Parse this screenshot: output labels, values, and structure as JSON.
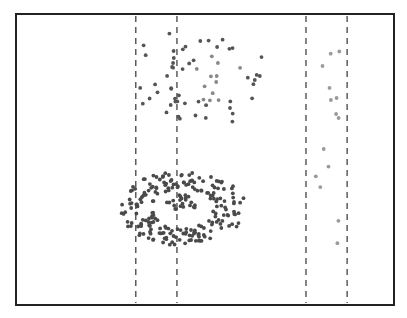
{
  "chart_data": {
    "type": "scatter",
    "title": "",
    "xlabel": "",
    "ylabel": "",
    "xlim": [
      0,
      100
    ],
    "ylim": [
      0,
      100
    ],
    "grid": false,
    "legend": "none",
    "vertical_dashed_lines_x": [
      31.5,
      42.5,
      77,
      88
    ],
    "clusters": [
      {
        "name": "upper-left-scatter",
        "shape": "uniform",
        "x_range": [
          31,
          46
        ],
        "y_range": [
          58,
          94
        ],
        "count": 18,
        "color": "#555555"
      },
      {
        "name": "upper-radial-cluster",
        "shape": "radial",
        "center": [
          53.5,
          78
        ],
        "radius": 14,
        "count": 45,
        "color": "#555555",
        "inner_color": "#888888"
      },
      {
        "name": "ring-cluster",
        "shape": "ring",
        "center": [
          44,
          33
        ],
        "rx_inner": 8,
        "rx_outer": 17,
        "ry_inner": 7,
        "ry_outer": 13,
        "count": 210,
        "color": "#4a4a4a"
      },
      {
        "name": "ring-core",
        "shape": "blob",
        "center": [
          44,
          35
        ],
        "radius": 3.5,
        "count": 22,
        "color": "#4a4a4a"
      },
      {
        "name": "right-band-sparse",
        "shape": "uniform",
        "x_range": [
          78,
          86
        ],
        "y_range": [
          20,
          90
        ],
        "count": 14,
        "color": "#9a9a9a"
      }
    ]
  }
}
